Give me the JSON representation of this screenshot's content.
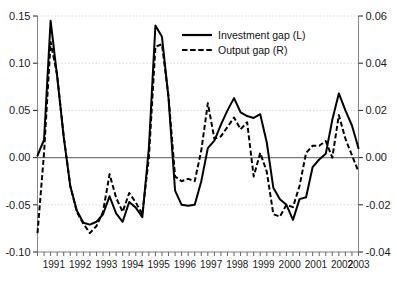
{
  "chart_data": {
    "type": "line",
    "title": "",
    "subtitle": "",
    "xlabel": "",
    "ylabel": "",
    "grid": true,
    "legend_position": "top-center",
    "x_tick_labels": [
      "1991",
      "1992",
      "1993",
      "1994",
      "1995",
      "1996",
      "1997",
      "1998",
      "1999",
      "2000",
      "2001",
      "2002",
      "2003"
    ],
    "x_minor_ticks_per_year": 4,
    "x_range": [
      "1990Q4",
      "2003Q2"
    ],
    "left_axis": {
      "name": "Investment gap (L)",
      "ylim": [
        -0.1,
        0.15
      ],
      "tick_labels": [
        "0.15",
        "0.10",
        "0.05",
        "0.00",
        "-0.05",
        "-0.10"
      ],
      "tick_values": [
        0.15,
        0.1,
        0.05,
        0.0,
        -0.05,
        -0.1
      ]
    },
    "right_axis": {
      "name": "Output gap (R)",
      "ylim": [
        -0.04,
        0.06
      ],
      "tick_labels": [
        "0.06",
        "0.04",
        "0.02",
        "0.00",
        "-0.02",
        "-0.04"
      ],
      "tick_values": [
        0.06,
        0.04,
        0.02,
        0.0,
        -0.02,
        -0.04
      ]
    },
    "legend": [
      {
        "label": "Investment gap (L)",
        "style": "solid",
        "axis": "left"
      },
      {
        "label": "Output gap (R)",
        "style": "dashed",
        "axis": "right"
      }
    ],
    "x": [
      "1990Q4",
      "1991Q1",
      "1991Q2",
      "1991Q3",
      "1991Q4",
      "1992Q1",
      "1992Q2",
      "1992Q3",
      "1992Q4",
      "1993Q1",
      "1993Q2",
      "1993Q3",
      "1993Q4",
      "1994Q1",
      "1994Q2",
      "1994Q3",
      "1994Q4",
      "1995Q1",
      "1995Q2",
      "1995Q3",
      "1995Q4",
      "1996Q1",
      "1996Q2",
      "1996Q3",
      "1996Q4",
      "1997Q1",
      "1997Q2",
      "1997Q3",
      "1997Q4",
      "1998Q1",
      "1998Q2",
      "1998Q3",
      "1998Q4",
      "1999Q1",
      "1999Q2",
      "1999Q3",
      "1999Q4",
      "2000Q1",
      "2000Q2",
      "2000Q3",
      "2000Q4",
      "2001Q1",
      "2001Q2",
      "2001Q3",
      "2001Q4",
      "2002Q1",
      "2002Q2",
      "2002Q3",
      "2002Q4",
      "2003Q1"
    ],
    "series": [
      {
        "name": "Investment gap (L)",
        "style": "solid",
        "axis": "left",
        "values": [
          0.002,
          0.019,
          0.145,
          0.086,
          0.022,
          -0.03,
          -0.056,
          -0.069,
          -0.071,
          -0.068,
          -0.06,
          -0.041,
          -0.059,
          -0.068,
          -0.047,
          -0.053,
          -0.063,
          0.01,
          0.14,
          0.128,
          0.063,
          -0.035,
          -0.05,
          -0.051,
          -0.05,
          -0.025,
          0.01,
          0.018,
          0.035,
          0.05,
          0.063,
          0.048,
          0.044,
          0.042,
          0.046,
          0.016,
          -0.032,
          -0.044,
          -0.05,
          -0.066,
          -0.044,
          -0.042,
          -0.01,
          -0.002,
          0.004,
          0.04,
          0.068,
          0.05,
          0.034,
          0.01
        ]
      },
      {
        "name": "Output gap (R)",
        "style": "dashed",
        "axis": "right",
        "values": [
          -0.032,
          0.002,
          0.049,
          0.035,
          0.009,
          -0.012,
          -0.023,
          -0.028,
          -0.032,
          -0.029,
          -0.023,
          -0.007,
          -0.017,
          -0.023,
          -0.015,
          -0.019,
          -0.024,
          0.0,
          0.047,
          0.048,
          0.026,
          -0.008,
          -0.01,
          -0.009,
          -0.01,
          0.003,
          0.023,
          0.008,
          0.009,
          0.013,
          0.017,
          0.012,
          0.015,
          -0.008,
          0.002,
          -0.006,
          -0.024,
          -0.025,
          -0.02,
          -0.021,
          -0.012,
          0.002,
          0.005,
          0.005,
          0.007,
          0.0,
          0.018,
          0.008,
          0.001,
          -0.006
        ]
      }
    ]
  }
}
